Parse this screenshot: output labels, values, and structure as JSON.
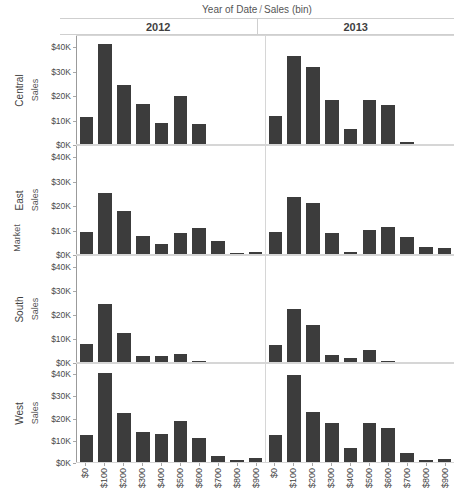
{
  "header": {
    "column_field_left": "Year of Date",
    "column_field_separator": "/",
    "column_field_right": "Sales (bin)",
    "columns": [
      "2012",
      "2013"
    ]
  },
  "row_field_title": "Market",
  "measure_label": "Sales",
  "colors": {
    "bar": "#3c3c3c",
    "grid": "#d6d6d6",
    "text": "#3f3f3f"
  },
  "chart_data": {
    "type": "bar",
    "xlabel": "Sales (bin)",
    "ylabel": "Sales",
    "grid": false,
    "legend": "none",
    "ylim": [
      0,
      45000
    ],
    "yticks": [
      0,
      10000,
      20000,
      30000,
      40000
    ],
    "ytick_labels": [
      "$0K",
      "$10K",
      "$20K",
      "$30K",
      "$40K"
    ],
    "categories": [
      "$0",
      "$100",
      "$200",
      "$300",
      "$400",
      "$500",
      "$600",
      "$700",
      "$800",
      "$900"
    ],
    "row_dimension": "Market",
    "column_dimension": "Year of Date",
    "rows": [
      "Central",
      "East",
      "South",
      "West"
    ],
    "columns": [
      "2012",
      "2013"
    ],
    "panels": [
      {
        "row": "Central",
        "column": "2012",
        "values": [
          11000,
          41000,
          24000,
          16500,
          8500,
          19500,
          8000,
          0,
          0,
          0
        ]
      },
      {
        "row": "Central",
        "column": "2013",
        "values": [
          11500,
          36000,
          31500,
          18000,
          6000,
          18000,
          16000,
          1000,
          0,
          0
        ]
      },
      {
        "row": "East",
        "column": "2012",
        "values": [
          9000,
          25000,
          17500,
          7500,
          4000,
          8500,
          10500,
          5500,
          500,
          1000
        ]
      },
      {
        "row": "East",
        "column": "2013",
        "values": [
          9000,
          23500,
          21000,
          8500,
          800,
          10000,
          11000,
          7000,
          3000,
          2500
        ]
      },
      {
        "row": "South",
        "column": "2012",
        "values": [
          7500,
          24000,
          12000,
          2500,
          2500,
          3500,
          500,
          0,
          0,
          0
        ]
      },
      {
        "row": "South",
        "column": "2013",
        "values": [
          7000,
          22000,
          15500,
          3000,
          1500,
          5000,
          500,
          0,
          0,
          0
        ]
      },
      {
        "row": "West",
        "column": "2012",
        "values": [
          12000,
          40000,
          22000,
          13500,
          12500,
          18500,
          11000,
          2500,
          1000,
          2000
        ]
      },
      {
        "row": "West",
        "column": "2013",
        "values": [
          12000,
          39000,
          22500,
          17500,
          6500,
          17500,
          15500,
          4000,
          1000,
          1500
        ]
      }
    ]
  }
}
